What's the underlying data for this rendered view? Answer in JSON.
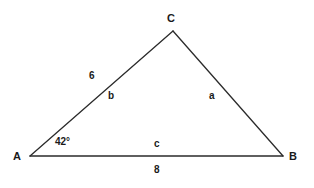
{
  "diagram": {
    "type": "triangle",
    "background_color": "#ffffff",
    "stroke_color": "#2b2b2b",
    "text_color": "#1a1a1a",
    "vertices": [
      {
        "name": "C",
        "label": "C",
        "x": 173,
        "y": 31
      },
      {
        "name": "A",
        "label": "A",
        "x": 30,
        "y": 156
      },
      {
        "name": "B",
        "label": "B",
        "x": 283,
        "y": 156
      }
    ],
    "sides": [
      {
        "name": "b",
        "label": "b",
        "between": "A-C",
        "length_label": "6"
      },
      {
        "name": "a",
        "label": "a",
        "between": "C-B",
        "length_label": ""
      },
      {
        "name": "c",
        "label": "c",
        "between": "A-B",
        "length_label": "8"
      }
    ],
    "angles": [
      {
        "at": "A",
        "label": "42°"
      }
    ],
    "labels": {
      "vertex_c": "C",
      "vertex_a": "A",
      "vertex_b": "B",
      "side_b": "b",
      "side_a": "a",
      "side_c": "c",
      "length_b": "6",
      "length_c": "8",
      "angle_a": "42°"
    }
  }
}
